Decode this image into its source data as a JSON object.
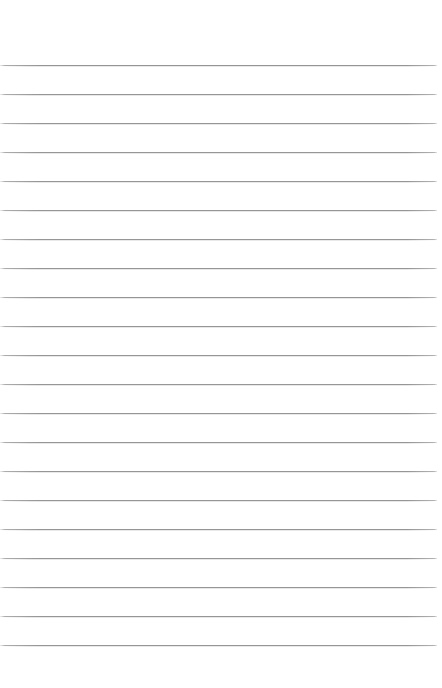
{
  "page": {
    "name": "lined-paper-sheet",
    "width": 442,
    "height": 688,
    "background_color": "#ffffff",
    "content_text": ""
  },
  "ruling": {
    "line_color": "#9e9e9e",
    "line_thickness": 1,
    "line_count": 21,
    "first_line_y": 65,
    "line_spacing": 29,
    "last_line_y": 645,
    "line_start_x": 0,
    "line_end_x": 437,
    "top_margin": 65,
    "bottom_margin": 43,
    "left_margin": 0,
    "right_margin": 5,
    "lines_y": [
      65,
      94,
      123,
      152,
      181,
      210,
      239,
      268,
      297,
      326,
      355,
      384,
      413,
      442,
      471,
      500,
      529,
      558,
      587,
      616,
      645
    ]
  }
}
